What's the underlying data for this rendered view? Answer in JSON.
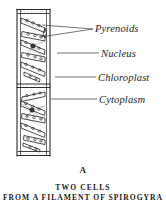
{
  "figure": {
    "letter": "A",
    "caption_line_1": "TWO CELLS",
    "caption_line_2": "FROM A FILAMENT OF SPIROGYRA",
    "background_color": "#ffffff",
    "ink_color": "#232323"
  },
  "labels": [
    {
      "id": "pyrenoids",
      "text": "Pyrenoids"
    },
    {
      "id": "nucleus",
      "text": "Nucleus"
    },
    {
      "id": "chloroplast",
      "text": "Chloroplast"
    },
    {
      "id": "cytoplasm",
      "text": "Cytoplasm"
    }
  ],
  "diagram": {
    "filament_left": 17,
    "filament_right": 50,
    "filament_top": 9,
    "filament_bottom": 156,
    "cross_wall_y": 85,
    "cells": 2,
    "structures": [
      "cell-wall",
      "cross-wall",
      "spiral-chloroplast",
      "pyrenoid",
      "nucleus",
      "cytoplasm"
    ]
  }
}
